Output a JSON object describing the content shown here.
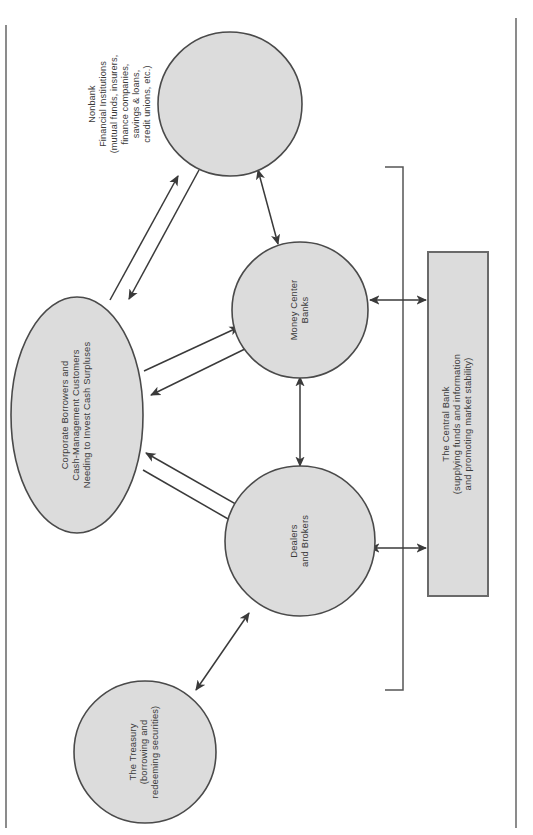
{
  "diagram": {
    "colors": {
      "node_fill": "#dcdcdc",
      "node_stroke": "#4a4a4a",
      "edge": "#3a3a3a",
      "bracket": "#555555",
      "page_border": "#6f6f6f",
      "text": "#3a3a3a",
      "background": "#ffffff"
    },
    "nodes": [
      {
        "id": "nonbank",
        "shape": "circle",
        "lines": [
          "Nonbank",
          "Financial Institutions",
          "(mutual funds, insurers,",
          "finance companies,",
          "savings & loans,",
          "credit unions, etc.)"
        ]
      },
      {
        "id": "money-center-banks",
        "shape": "circle",
        "lines": [
          "Money Center",
          "Banks"
        ]
      },
      {
        "id": "corporate-borrowers",
        "shape": "ellipse",
        "lines": [
          "Corporate Borrowers and",
          "Cash-Management Customers",
          "Needing to Invest Cash Surpluses"
        ]
      },
      {
        "id": "dealers-brokers",
        "shape": "circle",
        "lines": [
          "Dealers",
          "and Brokers"
        ]
      },
      {
        "id": "treasury",
        "shape": "circle",
        "lines": [
          "The Treasury",
          "(borrowing and",
          "redeeming securities)"
        ]
      },
      {
        "id": "central-bank",
        "shape": "rectangle",
        "lines": [
          "The Central Bank",
          "(supplying funds and information",
          "and promoting market stability)"
        ]
      }
    ],
    "edges": [
      {
        "from": "corporate-borrowers",
        "to": "nonbank",
        "style": "single-arrow-pair"
      },
      {
        "from": "corporate-borrowers",
        "to": "money-center-banks",
        "style": "single-arrow-pair"
      },
      {
        "from": "corporate-borrowers",
        "to": "dealers-brokers",
        "style": "single-arrow-pair"
      },
      {
        "from": "nonbank",
        "to": "money-center-banks",
        "style": "double-arrow"
      },
      {
        "from": "money-center-banks",
        "to": "dealers-brokers",
        "style": "double-arrow"
      },
      {
        "from": "dealers-brokers",
        "to": "treasury",
        "style": "double-arrow"
      },
      {
        "from": "money-center-banks",
        "to": "central-bank",
        "style": "double-arrow"
      },
      {
        "from": "dealers-brokers",
        "to": "central-bank",
        "style": "double-arrow"
      }
    ]
  }
}
